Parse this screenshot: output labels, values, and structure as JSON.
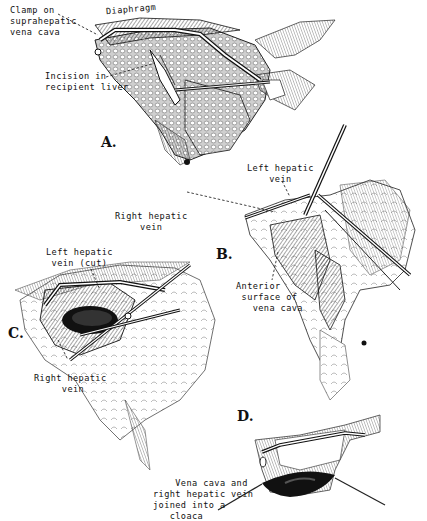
{
  "figure": {
    "panels": [
      {
        "id": "A",
        "letter": "A.",
        "labels": {
          "clamp": "Clamp on\nsuprahepatic\nvena cava",
          "diaphragm": "Diaphragm",
          "incision": "Incision in\nrecipient liver"
        }
      },
      {
        "id": "B",
        "letter": "B.",
        "labels": {
          "left_hepatic_vein": "Left hepatic\nvein",
          "right_hepatic_vein": "Right hepatic\nvein",
          "anterior_surface": "Anterior\n surface of\n   vena cava"
        }
      },
      {
        "id": "C",
        "letter": "C.",
        "labels": {
          "left_hepatic_vein_cut": "Left hepatic\nvein (cut)",
          "right_hepatic_vein": "Right hepatic\n     vein"
        }
      },
      {
        "id": "D",
        "letter": "D.",
        "labels": {
          "cloaca": "    Vena cava and\nright hepatic vein\njoined into a\n   cloaca"
        }
      }
    ],
    "colors": {
      "ink": "#111111",
      "paper": "#ffffff",
      "shade": "#555555"
    }
  }
}
